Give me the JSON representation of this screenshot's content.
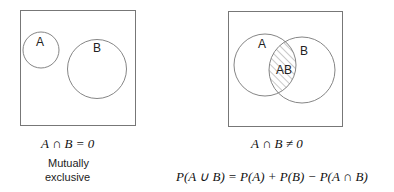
{
  "left_diagram": {
    "circle_a_label": "A",
    "circle_b_label": "B",
    "equation": "A ∩ B = 0",
    "caption_line1": "Mutually",
    "caption_line2": "exclusive"
  },
  "right_diagram": {
    "circle_a_label": "A",
    "circle_b_label": "B",
    "intersection_label": "AB",
    "equation": "A ∩ B ≠ 0"
  },
  "formula": "P(A ∪ B) = P(A) + P(B) − P(A ∩ B)",
  "colors": {
    "stroke": "#777777",
    "text": "#222222",
    "background": "#ffffff"
  }
}
